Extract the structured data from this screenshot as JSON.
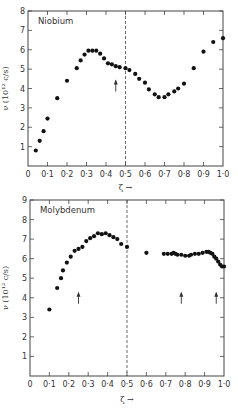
{
  "chart_data": [
    {
      "type": "scatter",
      "title": "Niobium",
      "xlabel": "ζ →",
      "ylabel": "ν (10¹² c/s)",
      "xlim": [
        0,
        1.0
      ],
      "ylim": [
        0,
        8
      ],
      "x_ticks": [
        "0",
        "0·1",
        "0·2",
        "0·3",
        "0·4",
        "0·5",
        "0·6",
        "0·7",
        "0·8",
        "0·9",
        "1·0"
      ],
      "y_ticks": [
        "1",
        "2",
        "3",
        "4",
        "5",
        "6",
        "7",
        "8"
      ],
      "grid": false,
      "vertical_dashed_line_x": 0.5,
      "arrows_x": [
        0.45
      ],
      "series": [
        {
          "name": "Niobium",
          "x": [
            0.04,
            0.06,
            0.08,
            0.1,
            0.15,
            0.2,
            0.25,
            0.27,
            0.29,
            0.31,
            0.33,
            0.35,
            0.37,
            0.39,
            0.41,
            0.43,
            0.45,
            0.47,
            0.5,
            0.52,
            0.55,
            0.57,
            0.6,
            0.62,
            0.65,
            0.67,
            0.7,
            0.72,
            0.75,
            0.77,
            0.8,
            0.85,
            0.9,
            0.95,
            1.0
          ],
          "y": [
            0.8,
            1.3,
            1.8,
            2.45,
            3.5,
            4.4,
            5.05,
            5.45,
            5.75,
            5.95,
            5.95,
            5.95,
            5.8,
            5.55,
            5.3,
            5.25,
            5.15,
            5.1,
            5.05,
            4.95,
            4.75,
            4.5,
            4.3,
            3.95,
            3.7,
            3.55,
            3.55,
            3.7,
            3.85,
            4.0,
            4.25,
            5.05,
            5.9,
            6.4,
            6.6
          ]
        }
      ]
    },
    {
      "type": "scatter",
      "title": "Molybdenum",
      "xlabel": "ζ →",
      "ylabel": "ν (10¹² c/s)",
      "xlim": [
        0,
        1.0
      ],
      "ylim": [
        0,
        9
      ],
      "x_ticks": [
        "0",
        "0·1",
        "0·2",
        "0·3",
        "0·4",
        "0·5",
        "0·6",
        "0·7",
        "0·8",
        "0·9",
        "1·0"
      ],
      "y_ticks": [
        "1",
        "2",
        "3",
        "4",
        "5",
        "6",
        "7",
        "8",
        "9"
      ],
      "grid": false,
      "vertical_dashed_line_x": 0.5,
      "arrows_x": [
        0.25,
        0.78,
        0.96
      ],
      "series": [
        {
          "name": "Molybdenum",
          "x": [
            0.1,
            0.14,
            0.16,
            0.17,
            0.19,
            0.21,
            0.23,
            0.25,
            0.27,
            0.29,
            0.31,
            0.33,
            0.35,
            0.37,
            0.39,
            0.41,
            0.43,
            0.45,
            0.47,
            0.5,
            0.6,
            0.69,
            0.71,
            0.73,
            0.74,
            0.75,
            0.76,
            0.78,
            0.8,
            0.82,
            0.83,
            0.85,
            0.87,
            0.89,
            0.91,
            0.92,
            0.93,
            0.94,
            0.95,
            0.96,
            0.97,
            0.98,
            0.99,
            1.0
          ],
          "y": [
            3.4,
            4.5,
            5.0,
            5.4,
            5.8,
            6.1,
            6.4,
            6.5,
            6.6,
            6.9,
            7.05,
            7.15,
            7.3,
            7.25,
            7.3,
            7.2,
            7.1,
            7.0,
            6.75,
            6.6,
            6.3,
            6.25,
            6.25,
            6.25,
            6.3,
            6.25,
            6.2,
            6.2,
            6.15,
            6.15,
            6.2,
            6.25,
            6.25,
            6.3,
            6.35,
            6.35,
            6.3,
            6.25,
            6.1,
            6.0,
            5.85,
            5.7,
            5.6,
            5.6
          ]
        }
      ]
    }
  ]
}
